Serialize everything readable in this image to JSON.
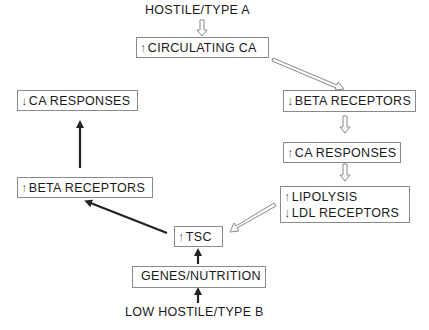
{
  "nodes": {
    "hostile_type_a": {
      "text": "HOSTILE/TYPE A"
    },
    "circulating_ca": {
      "direction": "↑",
      "text": "CIRCULATING CA"
    },
    "beta_receptors_down": {
      "direction": "↓",
      "text": "BETA RECEPTORS"
    },
    "ca_responses_up": {
      "direction": "↑",
      "text": "CA RESPONSES"
    },
    "lipolysis_ldl": {
      "lines": [
        {
          "direction": "↑",
          "text": "LIPOLYSIS"
        },
        {
          "direction": "↓",
          "text": "LDL RECEPTORS"
        }
      ]
    },
    "tsc": {
      "direction": "↑",
      "text": "TSC"
    },
    "beta_receptors_up": {
      "direction": "↑",
      "text": "BETA RECEPTORS"
    },
    "ca_responses_down": {
      "direction": "↓",
      "text": "CA RESPONSES"
    },
    "genes_nutrition": {
      "text": "GENES/NUTRITION"
    },
    "low_hostile_type_b": {
      "text": "LOW HOSTILE/TYPE B"
    }
  },
  "edges": [
    {
      "from": "hostile_type_a",
      "to": "circulating_ca",
      "style": "hollow"
    },
    {
      "from": "circulating_ca",
      "to": "beta_receptors_down",
      "style": "hollow"
    },
    {
      "from": "beta_receptors_down",
      "to": "ca_responses_up",
      "style": "hollow"
    },
    {
      "from": "ca_responses_up",
      "to": "lipolysis_ldl",
      "style": "hollow"
    },
    {
      "from": "lipolysis_ldl",
      "to": "tsc",
      "style": "hollow"
    },
    {
      "from": "low_hostile_type_b",
      "to": "genes_nutrition",
      "style": "solid"
    },
    {
      "from": "genes_nutrition",
      "to": "tsc",
      "style": "solid"
    },
    {
      "from": "tsc",
      "to": "beta_receptors_up",
      "style": "solid"
    },
    {
      "from": "beta_receptors_up",
      "to": "ca_responses_down",
      "style": "solid"
    }
  ]
}
